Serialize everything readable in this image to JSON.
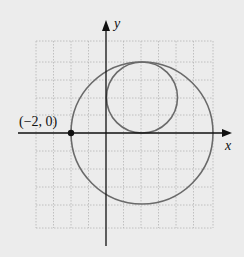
{
  "figure": {
    "axes": {
      "x_label": "x",
      "y_label": "y"
    },
    "point_label": "(−2, 0)",
    "point": {
      "x": -2,
      "y": 0
    },
    "circles": [
      {
        "name": "large",
        "center": [
          2,
          0
        ],
        "radius": 4
      },
      {
        "name": "small",
        "center": [
          2,
          2
        ],
        "radius": 2
      }
    ],
    "grid": {
      "x_range": [
        -4,
        6
      ],
      "y_range": [
        -5,
        5
      ],
      "step": 1
    },
    "colors": {
      "background": "#ececec",
      "grid": "#b5b5b5",
      "circle": "#6a6a6a",
      "axis": "#111111"
    }
  }
}
